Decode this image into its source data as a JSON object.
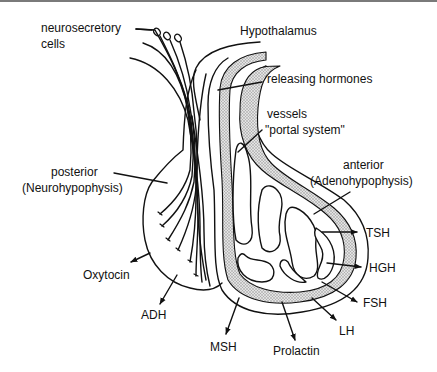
{
  "diagram": {
    "labels": {
      "neurosecretory_line1": "neurosecretory",
      "neurosecretory_line2": "cells",
      "hypothalamus": "Hypothalamus",
      "releasing_hormones": "releasing hormones",
      "vessels": "vessels",
      "portal_system": "\"portal system\"",
      "posterior_line1": "posterior",
      "posterior_line2": "(Neurohypophysis)",
      "anterior_line1": "anterior",
      "anterior_line2": "(Adenohypophysis)"
    },
    "posterior_hormones": [
      "Oxytocin",
      "ADH"
    ],
    "anterior_hormones": [
      "TSH",
      "HGH",
      "FSH",
      "LH",
      "Prolactin",
      "MSH"
    ],
    "colors": {
      "line": "#111111",
      "vessel_fill": "#c8c8c8",
      "background": "#ffffff",
      "top_rule": "#7a7a7a"
    }
  }
}
